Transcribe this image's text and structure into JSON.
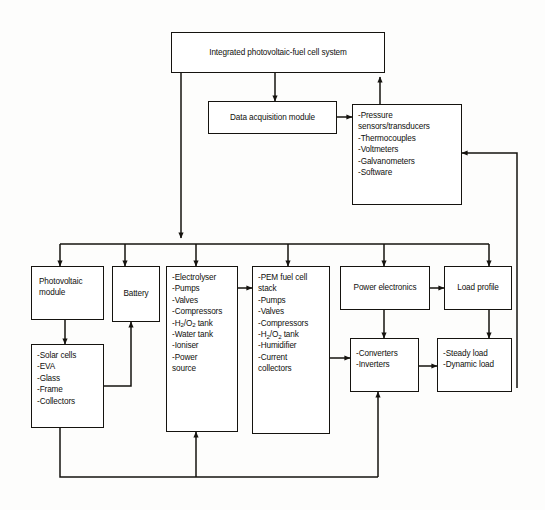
{
  "diagram": {
    "type": "block-flow-diagram",
    "canvas": {
      "width": 545,
      "height": 510,
      "background": "#fdfdfc"
    },
    "style": {
      "box_border": "#15130f",
      "wire": "#15130f",
      "text": "#100f0c"
    },
    "nodes": {
      "system": {
        "label": "Integrated photovoltaic-fuel cell system"
      },
      "daq": {
        "label": "Data acquisition module"
      },
      "instruments": {
        "items": [
          "-Pressure",
          "sensors/transducers",
          "-Thermocouples",
          "-Voltmeters",
          "-Galvanometers",
          "-Software",
          "……"
        ]
      },
      "pv_module": {
        "lines": [
          "Photovoltaic",
          "module"
        ]
      },
      "battery": {
        "label": "Battery"
      },
      "electrolyser": {
        "items": [
          "-Electrolyser",
          "-Pumps",
          "-Valves",
          "-Compressors",
          "-H2/O2 tank",
          "-Water tank",
          "-Ioniser",
          "-Power",
          "source"
        ]
      },
      "pem_stack": {
        "items": [
          "-PEM fuel cell",
          "stack",
          "-Pumps",
          "-Valves",
          "-Compressors",
          "-H2/O2 tank",
          "-Humidifier",
          "-Current",
          "collectors"
        ]
      },
      "power_electronics": {
        "label": "Power electronics"
      },
      "load_profile": {
        "label": "Load profile"
      },
      "pv_parts": {
        "items": [
          "-Solar cells",
          "-EVA",
          "-Glass",
          "-Frame",
          "-Collectors"
        ]
      },
      "converters": {
        "items": [
          "-Converters",
          "-Inverters"
        ]
      },
      "loads": {
        "items": [
          "-Steady load",
          "-Dynamic load"
        ]
      }
    },
    "edges": [
      {
        "from": "system",
        "to": "daq",
        "kind": "arrow-down"
      },
      {
        "from": "system",
        "to": "distribution-bus",
        "kind": "arrow-down"
      },
      {
        "from": "instruments",
        "to": "system",
        "kind": "arrow-up"
      },
      {
        "from": "daq",
        "to": "instruments",
        "kind": "arrow-right"
      },
      {
        "from": "loads",
        "to": "instruments",
        "kind": "feedback-arrow-left"
      },
      {
        "from": "distribution-bus",
        "to": "pv_module",
        "kind": "arrow-down"
      },
      {
        "from": "distribution-bus",
        "to": "battery",
        "kind": "arrow-down"
      },
      {
        "from": "distribution-bus",
        "to": "electrolyser",
        "kind": "arrow-down"
      },
      {
        "from": "distribution-bus",
        "to": "pem_stack",
        "kind": "arrow-down"
      },
      {
        "from": "distribution-bus",
        "to": "power_electronics",
        "kind": "arrow-down"
      },
      {
        "from": "distribution-bus",
        "to": "load_profile",
        "kind": "arrow-down"
      },
      {
        "from": "pv_module",
        "to": "pv_parts",
        "kind": "arrow-down"
      },
      {
        "from": "pv_parts",
        "to": "battery",
        "kind": "arrow-up"
      },
      {
        "from": "electrolyser",
        "to": "pem_stack",
        "kind": "arrow-right"
      },
      {
        "from": "pem_stack",
        "to": "converters",
        "kind": "arrow-right"
      },
      {
        "from": "power_electronics",
        "to": "load_profile",
        "kind": "arrow-right"
      },
      {
        "from": "power_electronics",
        "to": "converters",
        "kind": "arrow-down"
      },
      {
        "from": "load_profile",
        "to": "loads",
        "kind": "arrow-down"
      },
      {
        "from": "converters",
        "to": "loads",
        "kind": "arrow-right"
      },
      {
        "from": "pv_parts",
        "to": "bottom-bus",
        "kind": "line-down"
      },
      {
        "from": "bottom-bus",
        "to": "electrolyser",
        "kind": "arrow-up"
      },
      {
        "from": "bottom-bus",
        "to": "converters",
        "kind": "arrow-up"
      }
    ]
  }
}
